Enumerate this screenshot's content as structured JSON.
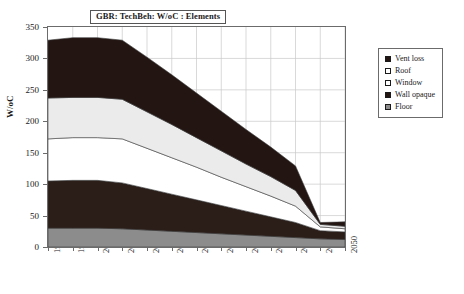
{
  "chart_data": {
    "type": "area",
    "title": "GBR: TechBeh: W/oC : Elements",
    "xlabel": "",
    "ylabel": "W/oC",
    "stacked": true,
    "grid": true,
    "legend_position": "right",
    "ylim": [
      0,
      350
    ],
    "yticks": [
      0,
      50,
      100,
      150,
      200,
      250,
      300,
      350
    ],
    "xlim": [
      1990,
      2050
    ],
    "categories": [
      "1990",
      "1995",
      "2000",
      "2005",
      "2010",
      "2015",
      "2020",
      "2025",
      "2030",
      "2035",
      "2040",
      "2045",
      "2050"
    ],
    "series": [
      {
        "name": "Floor",
        "color": "#8c8c8c",
        "values": [
          30,
          30,
          30,
          29,
          27,
          25,
          23,
          21,
          19,
          17,
          15,
          13,
          12
        ]
      },
      {
        "name": "Wall opaque",
        "color": "#2b1d18",
        "values": [
          75,
          76,
          76,
          73,
          66,
          59,
          52,
          45,
          38,
          31,
          24,
          13,
          12
        ]
      },
      {
        "name": "Window",
        "color": "#ffffff",
        "values": [
          67,
          68,
          68,
          70,
          64,
          58,
          52,
          45,
          39,
          33,
          26,
          6,
          5
        ]
      },
      {
        "name": "Roof",
        "color": "#ebebeb",
        "values": [
          65,
          64,
          64,
          63,
          58,
          53,
          47,
          42,
          36,
          31,
          25,
          4,
          4
        ]
      },
      {
        "name": "Vent loss",
        "color": "#231512",
        "values": [
          92,
          95,
          95,
          94,
          87,
          79,
          71,
          63,
          55,
          47,
          39,
          3,
          7
        ]
      }
    ],
    "totals": [
      329,
      333,
      333,
      329,
      302,
      274,
      245,
      216,
      187,
      159,
      129,
      39,
      40
    ]
  },
  "legend": {
    "items": [
      {
        "label": "Vent loss",
        "swatch": "filled-dark"
      },
      {
        "label": "Roof",
        "swatch": "light"
      },
      {
        "label": "Window",
        "swatch": "white"
      },
      {
        "label": "Wall opaque",
        "swatch": "filled-dark"
      },
      {
        "label": "Floor",
        "swatch": "gray"
      }
    ]
  }
}
